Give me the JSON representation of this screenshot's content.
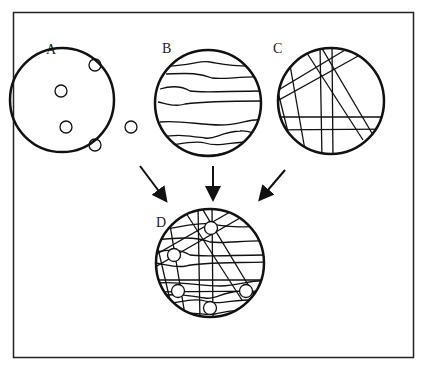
{
  "figure": {
    "panels": [
      {
        "label": "A",
        "content": "five small circles (inclusions) near the rim"
      },
      {
        "label": "B",
        "content": "wavy horizontal lines"
      },
      {
        "label": "C",
        "content": "crossing straight lines"
      },
      {
        "label": "D",
        "content": "superposition of A, B and C"
      }
    ],
    "arrows": [
      {
        "from": "A",
        "to": "D"
      },
      {
        "from": "B",
        "to": "D"
      },
      {
        "from": "C",
        "to": "D"
      }
    ],
    "colors": {
      "stroke": "#111111",
      "background": "#ffffff"
    }
  }
}
